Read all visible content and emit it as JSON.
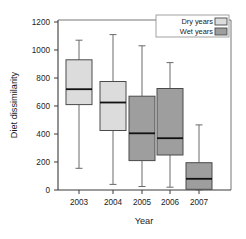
{
  "chart_data": {
    "type": "box",
    "title": "",
    "xlabel": "Year",
    "ylabel": "Diet dissimilarity",
    "categories": [
      "2003",
      "2004",
      "2005",
      "2006",
      "2007"
    ],
    "ylim": [
      0,
      1200
    ],
    "yticks": [
      0,
      200,
      400,
      600,
      800,
      1000,
      1200
    ],
    "ytick_labels": [
      "0",
      "200",
      "400",
      "600",
      "800",
      "1000",
      "1200"
    ],
    "grid": false,
    "legend_position": "top-right",
    "legend": [
      {
        "label": "Dry years",
        "color": "#dcdcdc"
      },
      {
        "label": "Wet years",
        "color": "#9e9e9e"
      }
    ],
    "boxes": [
      {
        "category": "2003",
        "group": "Dry years",
        "color": "#dcdcdc",
        "whisker_low": 155,
        "q1": 610,
        "median": 720,
        "q3": 930,
        "whisker_high": 1070
      },
      {
        "category": "2004",
        "group": "Dry years",
        "color": "#dcdcdc",
        "whisker_low": 40,
        "q1": 425,
        "median": 625,
        "q3": 775,
        "whisker_high": 1110
      },
      {
        "category": "2005",
        "group": "Wet years",
        "color": "#9e9e9e",
        "whisker_low": 25,
        "q1": 210,
        "median": 405,
        "q3": 670,
        "whisker_high": 1030
      },
      {
        "category": "2006",
        "group": "Wet years",
        "color": "#9e9e9e",
        "whisker_low": 20,
        "q1": 250,
        "median": 370,
        "q3": 725,
        "whisker_high": 910
      },
      {
        "category": "2007",
        "group": "Wet years",
        "color": "#9e9e9e",
        "whisker_low": 0,
        "q1": 5,
        "median": 80,
        "q3": 195,
        "whisker_high": 465
      }
    ]
  },
  "axes": {
    "y_title": "Diet dissimilarity",
    "x_title": "Year",
    "y_tick_labels": [
      "1200",
      "1000",
      "800",
      "600",
      "400",
      "200",
      "0"
    ],
    "x_tick_labels": [
      "2003",
      "2004",
      "2005",
      "2006",
      "2007"
    ]
  },
  "legend": {
    "entry_dry_label": "Dry years",
    "entry_wet_label": "Wet years"
  }
}
